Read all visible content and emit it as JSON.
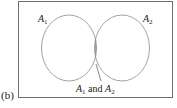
{
  "figure": {
    "panel_label": "(b)",
    "set_a": {
      "name": "A",
      "subscript": "1"
    },
    "set_b": {
      "name": "A",
      "subscript": "2"
    },
    "intersection_label": {
      "a": "A",
      "a_sub": "1",
      "conj": " and ",
      "b": "A",
      "b_sub": "2"
    },
    "colors": {
      "stroke": "#8c8c8c",
      "frame": "#6e6e6e",
      "intersection_fill": "#a8a8a8"
    }
  }
}
